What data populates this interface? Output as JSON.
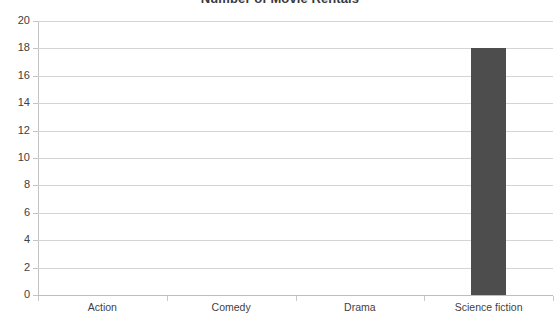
{
  "chart_data": {
    "type": "bar",
    "title": "Number of Movie Rentals",
    "xlabel": "",
    "ylabel": "",
    "categories": [
      "Action",
      "Comedy",
      "Drama",
      "Science fiction"
    ],
    "values": [
      0,
      0,
      0,
      18
    ],
    "series": [
      {
        "name": "Number of Movie Rentals",
        "values": [
          0,
          0,
          0,
          18
        ]
      }
    ],
    "ylim": [
      0,
      20
    ],
    "ytick_step": 2,
    "ytick_labels": [
      "0",
      "2",
      "4",
      "6",
      "8",
      "10",
      "12",
      "14",
      "16",
      "18",
      "20"
    ],
    "grid": "horizontal",
    "legend": "none",
    "bar_color": "#4d4d4d",
    "gridline_color": "#d4d4d4",
    "axis_color": "#bdbdbd",
    "text_color": "#404040",
    "background_color": "#ffffff"
  }
}
